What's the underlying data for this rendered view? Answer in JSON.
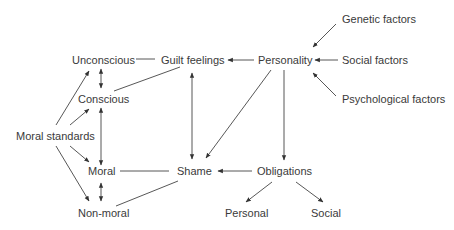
{
  "diagram": {
    "type": "concept-map",
    "nodes": {
      "genetic_factors": "Genetic factors",
      "unconscious": "Unconscious",
      "guilt_feelings": "Guilt feelings",
      "personality": "Personality",
      "social_factors": "Social factors",
      "conscious": "Conscious",
      "psychological_factors": "Psychological factors",
      "moral_standards": "Moral standards",
      "moral": "Moral",
      "shame": "Shame",
      "obligations": "Obligations",
      "non_moral": "Non-moral",
      "personal": "Personal",
      "social": "Social"
    },
    "edges": [
      {
        "from": "Genetic factors",
        "to": "Personality",
        "type": "arrow"
      },
      {
        "from": "Social factors",
        "to": "Personality",
        "type": "arrow"
      },
      {
        "from": "Psychological factors",
        "to": "Personality",
        "type": "arrow"
      },
      {
        "from": "Personality",
        "to": "Guilt feelings",
        "type": "arrow"
      },
      {
        "from": "Personality",
        "to": "Shame",
        "type": "arrow"
      },
      {
        "from": "Personality",
        "to": "Obligations",
        "type": "arrow"
      },
      {
        "from": "Guilt feelings",
        "to": "Unconscious",
        "type": "line"
      },
      {
        "from": "Guilt feelings",
        "to": "Conscious",
        "type": "line"
      },
      {
        "from": "Guilt feelings",
        "to": "Shame",
        "type": "double-arrow"
      },
      {
        "from": "Unconscious",
        "to": "Conscious",
        "type": "double-arrow"
      },
      {
        "from": "Conscious",
        "to": "Moral",
        "type": "double-arrow"
      },
      {
        "from": "Moral",
        "to": "Non-moral",
        "type": "double-arrow"
      },
      {
        "from": "Moral standards",
        "to": "Unconscious",
        "type": "arrow"
      },
      {
        "from": "Moral standards",
        "to": "Conscious",
        "type": "arrow"
      },
      {
        "from": "Moral standards",
        "to": "Moral",
        "type": "arrow"
      },
      {
        "from": "Moral standards",
        "to": "Non-moral",
        "type": "arrow"
      },
      {
        "from": "Shame",
        "to": "Moral",
        "type": "line"
      },
      {
        "from": "Shame",
        "to": "Non-moral",
        "type": "line"
      },
      {
        "from": "Obligations",
        "to": "Shame",
        "type": "arrow"
      },
      {
        "from": "Obligations",
        "to": "Personal",
        "type": "arrow"
      },
      {
        "from": "Obligations",
        "to": "Social",
        "type": "arrow"
      }
    ]
  }
}
